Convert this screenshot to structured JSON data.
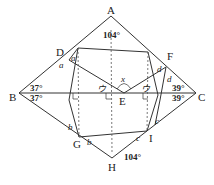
{
  "diagram": {
    "type": "geometry-figure",
    "points": {
      "A": {
        "label": "A",
        "x": 111,
        "y": 16
      },
      "B": {
        "label": "B",
        "x": 19,
        "y": 93
      },
      "C": {
        "label": "C",
        "x": 196,
        "y": 93
      },
      "H": {
        "label": "H",
        "x": 112,
        "y": 158
      },
      "D": {
        "label": "D",
        "x": 69,
        "y": 52
      },
      "F": {
        "label": "F",
        "x": 166,
        "y": 64
      },
      "E": {
        "label": "E",
        "x": 124,
        "y": 93
      },
      "G": {
        "label": "G",
        "x": 79,
        "y": 137
      },
      "I": {
        "label": "I",
        "x": 147,
        "y": 131
      }
    },
    "angles": {
      "A_top": "104°",
      "H_bottom": "104°",
      "B_upper": "37°",
      "B_lower": "37°",
      "C_upper": "39°",
      "C_lower": "39°",
      "x_at_E": "x",
      "u_left": "ウ",
      "u_right": "ウ",
      "a1": "a",
      "a2": "a",
      "b1": "b",
      "b2": "b",
      "c1": "c",
      "c2": "c",
      "d1": "d",
      "d2": "d"
    },
    "colors": {
      "line": "#333333",
      "text": "#222222",
      "background": "#ffffff"
    }
  }
}
